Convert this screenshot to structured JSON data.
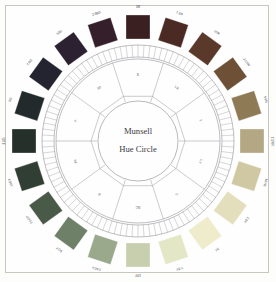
{
  "title": "Munsell Hue Circle",
  "center": {
    "line1": "Munsell",
    "line2": "Hue Circle"
  },
  "colors": {
    "background": "#fdfdfb",
    "panel": "#fefefe",
    "frame_border": "#c9c6c0",
    "ring_stroke": "#7e7e86",
    "line_stroke": "#8d8d93",
    "text": "#3b3b42"
  },
  "sectors": [
    {
      "label": "R",
      "angle": 0
    },
    {
      "label": "YR",
      "angle": 36
    },
    {
      "label": "Y",
      "angle": 72
    },
    {
      "label": "GY",
      "angle": 108
    },
    {
      "label": "G",
      "angle": 144
    },
    {
      "label": "BG",
      "angle": 180
    },
    {
      "label": "B",
      "angle": 216
    },
    {
      "label": "PB",
      "angle": 252
    },
    {
      "label": "P",
      "angle": 288
    },
    {
      "label": "RP",
      "angle": 324
    }
  ],
  "swatches": [
    {
      "label": "5R",
      "angle": 0,
      "color": "#3a2020"
    },
    {
      "label": "7.5R",
      "angle": 18,
      "color": "#4a2a22"
    },
    {
      "label": "10R",
      "angle": 36,
      "color": "#5a392a"
    },
    {
      "label": "2.5YR",
      "angle": 54,
      "color": "#6d5036"
    },
    {
      "label": "5YR",
      "angle": 72,
      "color": "#8e7a55"
    },
    {
      "label": "7.5YR",
      "angle": 90,
      "color": "#b4a884"
    },
    {
      "label": "10YR",
      "angle": 108,
      "color": "#cfc8a3"
    },
    {
      "label": "2.5Y",
      "angle": 126,
      "color": "#e3dfbc"
    },
    {
      "label": "5Y",
      "angle": 144,
      "color": "#eeeccb"
    },
    {
      "label": "7.5Y",
      "angle": 162,
      "color": "#e4e7c6"
    },
    {
      "label": "10Y",
      "angle": 180,
      "color": "#c8cfae"
    },
    {
      "label": "2.5GY",
      "angle": 198,
      "color": "#9aa88c"
    },
    {
      "label": "5GY",
      "angle": 216,
      "color": "#6f8068"
    },
    {
      "label": "7.5GY",
      "angle": 234,
      "color": "#4a5a48"
    },
    {
      "label": "10GY",
      "angle": 252,
      "color": "#313e33"
    },
    {
      "label": "2.5G",
      "angle": 270,
      "color": "#26302b"
    },
    {
      "label": "5G",
      "angle": 288,
      "color": "#222a2c"
    },
    {
      "label": "7.5G",
      "angle": 306,
      "color": "#232430"
    },
    {
      "label": "10G",
      "angle": 324,
      "color": "#2b2130"
    },
    {
      "label": "2.5BG",
      "angle": 342,
      "color": "#351f2a"
    }
  ],
  "tick_ring": {
    "count": 100,
    "label": "hue-step-cells"
  }
}
